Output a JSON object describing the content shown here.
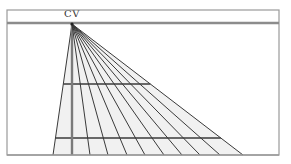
{
  "diagram": {
    "label_cv": "CV",
    "colors": {
      "frame": "#9a9a9a",
      "horizon": "#8c8c8c",
      "lines": "#3a3a3a",
      "shade": "#f1f1f1"
    },
    "frame": {
      "x1": 7,
      "y1": 10,
      "x2": 279,
      "y2": 155
    },
    "horizon_y": 24,
    "cv": {
      "x": 72,
      "y": 24
    },
    "baseline_y": 155,
    "fan_endpoints_x": [
      53,
      72,
      90,
      108,
      127,
      145,
      164,
      182,
      200,
      220,
      243
    ],
    "horizontal_lines": [
      {
        "y": 84,
        "label": "depth-line-1"
      },
      {
        "y": 138,
        "label": "depth-line-2"
      }
    ]
  }
}
